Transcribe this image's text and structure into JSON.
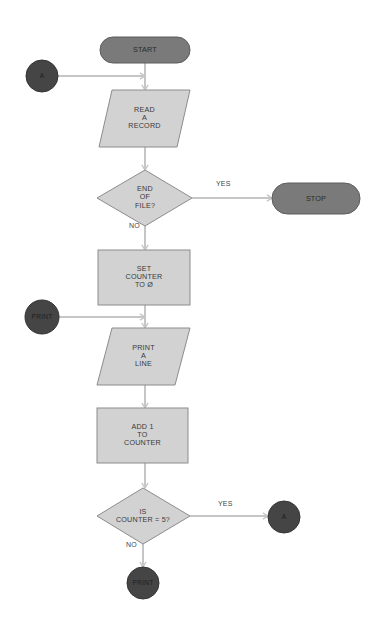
{
  "colors": {
    "terminal_fill": "#7a7a7a",
    "terminal_stroke": "#5c5c5c",
    "process_fill": "#d2d2d2",
    "process_stroke": "#8c8c8c",
    "connector_fill": "#454545",
    "connector_stroke": "#333333",
    "arrow": "#c6c6c6",
    "background": "#ffffff"
  },
  "nodes": {
    "start": {
      "type": "terminal",
      "label": "START",
      "x": 100,
      "y": 37,
      "w": 90,
      "h": 26
    },
    "conn_a_in": {
      "type": "connector",
      "label": "A",
      "cx": 42,
      "cy": 76,
      "r": 16
    },
    "read": {
      "type": "input-output",
      "label": "READ\nA\nRECORD",
      "top_left": 112,
      "top_right": 190,
      "bottom_left": 99,
      "bottom_right": 177,
      "y_top": 90,
      "y_bottom": 147
    },
    "eof": {
      "type": "decision",
      "label": "END\nOF\nFILE?",
      "cx": 145,
      "cy": 198,
      "left": 97,
      "right": 192,
      "top": 170,
      "bottom": 226
    },
    "stop": {
      "type": "terminal",
      "label": "STOP",
      "x": 272,
      "y": 183,
      "w": 88,
      "h": 31
    },
    "set": {
      "type": "process",
      "label": "SET\nCOUNTER\nTO Ø",
      "x": 98,
      "y": 250,
      "w": 92,
      "h": 55
    },
    "conn_print_in": {
      "type": "connector",
      "label": "PRINT",
      "cx": 42,
      "cy": 317,
      "r": 17
    },
    "print_line": {
      "type": "input-output",
      "label": "PRINT\nA\nLINE",
      "top_left": 112,
      "top_right": 190,
      "bottom_left": 97,
      "bottom_right": 175,
      "y_top": 328,
      "y_bottom": 385
    },
    "add": {
      "type": "process",
      "label": "ADD 1\nTO\nCOUNTER",
      "x": 97,
      "y": 408,
      "w": 91,
      "h": 55
    },
    "is5": {
      "type": "decision",
      "label": "IS\nCOUNTER = 5?",
      "cx": 143,
      "cy": 516,
      "left": 97,
      "right": 190,
      "top": 488,
      "bottom": 544
    },
    "conn_a_out": {
      "type": "connector",
      "label": "A",
      "cx": 284,
      "cy": 517,
      "r": 16
    },
    "conn_print_out": {
      "type": "connector",
      "label": "PRINT",
      "cx": 143,
      "cy": 583,
      "r": 16
    }
  },
  "edges": [
    {
      "from": "start",
      "to": "read",
      "points": [
        [
          145,
          63
        ],
        [
          145,
          90
        ]
      ]
    },
    {
      "from": "conn_a_in",
      "to": "read",
      "points": [
        [
          58,
          76
        ],
        [
          145,
          76
        ]
      ]
    },
    {
      "from": "read",
      "to": "eof",
      "points": [
        [
          145,
          147
        ],
        [
          145,
          170
        ]
      ]
    },
    {
      "from": "eof",
      "to": "stop",
      "label": "YES",
      "label_x": 216,
      "label_y": 185,
      "points": [
        [
          192,
          198
        ],
        [
          272,
          198
        ]
      ]
    },
    {
      "from": "eof",
      "to": "set",
      "label": "NO",
      "label_x": 129,
      "label_y": 227,
      "points": [
        [
          145,
          226
        ],
        [
          145,
          250
        ]
      ]
    },
    {
      "from": "set",
      "to": "print_line",
      "points": [
        [
          145,
          305
        ],
        [
          145,
          328
        ]
      ]
    },
    {
      "from": "conn_print_in",
      "to": "print_line",
      "points": [
        [
          59,
          317
        ],
        [
          145,
          317
        ]
      ]
    },
    {
      "from": "print_line",
      "to": "add",
      "points": [
        [
          145,
          385
        ],
        [
          145,
          408
        ]
      ]
    },
    {
      "from": "add",
      "to": "is5",
      "points": [
        [
          145,
          463
        ],
        [
          145,
          488
        ]
      ]
    },
    {
      "from": "is5",
      "to": "conn_a_out",
      "label": "YES",
      "label_x": 218,
      "label_y": 505,
      "points": [
        [
          190,
          516
        ],
        [
          268,
          516
        ]
      ]
    },
    {
      "from": "is5",
      "to": "conn_print_out",
      "label": "NO",
      "label_x": 126,
      "label_y": 546,
      "points": [
        [
          143,
          544
        ],
        [
          143,
          567
        ]
      ]
    }
  ],
  "edge_labels": {
    "eof_yes": "YES",
    "eof_no": "NO",
    "is5_yes": "YES",
    "is5_no": "NO"
  }
}
